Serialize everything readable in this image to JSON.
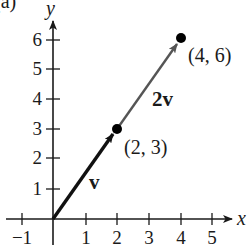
{
  "panel_label": "(a)",
  "axes": {
    "x_label": "x",
    "y_label": "y",
    "x_ticks": [
      "−1",
      "1",
      "2",
      "3",
      "4",
      "5"
    ],
    "y_ticks": [
      "1",
      "2",
      "3",
      "4",
      "5",
      "6"
    ]
  },
  "vectors": [
    {
      "name": "v",
      "label": "v",
      "from": [
        0,
        0
      ],
      "to": [
        2,
        3
      ],
      "color": "#111111"
    },
    {
      "name": "2v",
      "label": "2v",
      "from": [
        2,
        3
      ],
      "to": [
        4,
        6
      ],
      "color": "#555555"
    }
  ],
  "points": [
    {
      "label": "(2, 3)",
      "x": 2,
      "y": 3
    },
    {
      "label": "(4, 6)",
      "x": 4,
      "y": 6
    }
  ],
  "colors": {
    "axis": "#1a1a1a",
    "vector_v": "#111111",
    "vector_2v": "#555555",
    "point": "#000000"
  }
}
